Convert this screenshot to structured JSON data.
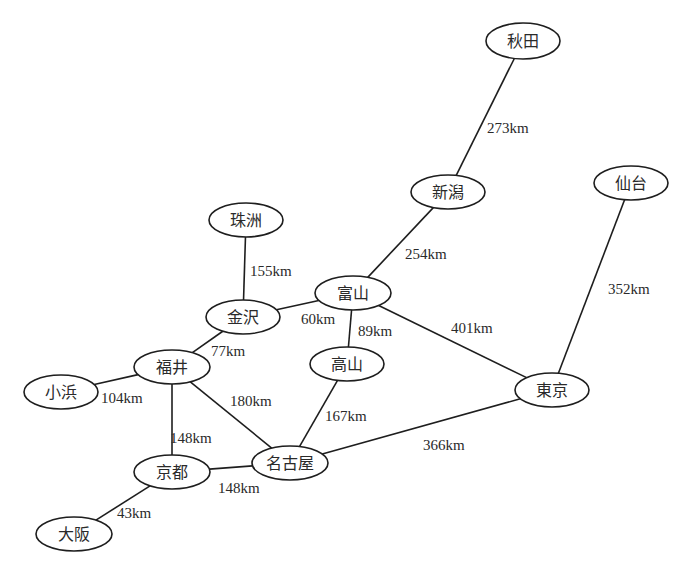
{
  "diagram": {
    "type": "graph",
    "nodes": [
      {
        "id": "akita",
        "label": "秋田",
        "x": 523,
        "y": 41,
        "rx": 37,
        "ry": 18
      },
      {
        "id": "niigata",
        "label": "新潟",
        "x": 448,
        "y": 192,
        "rx": 37,
        "ry": 17
      },
      {
        "id": "sendai",
        "label": "仙台",
        "x": 631,
        "y": 183,
        "rx": 37,
        "ry": 17
      },
      {
        "id": "suzu",
        "label": "珠洲",
        "x": 246,
        "y": 220,
        "rx": 37,
        "ry": 17
      },
      {
        "id": "toyama",
        "label": "富山",
        "x": 353,
        "y": 293,
        "rx": 38,
        "ry": 17
      },
      {
        "id": "kanazawa",
        "label": "金沢",
        "x": 243,
        "y": 317,
        "rx": 37,
        "ry": 17
      },
      {
        "id": "takayama",
        "label": "高山",
        "x": 347,
        "y": 364,
        "rx": 37,
        "ry": 17
      },
      {
        "id": "fukui",
        "label": "福井",
        "x": 172,
        "y": 367,
        "rx": 38,
        "ry": 17
      },
      {
        "id": "obama",
        "label": "小浜",
        "x": 61,
        "y": 392,
        "rx": 37,
        "ry": 17
      },
      {
        "id": "tokyo",
        "label": "東京",
        "x": 552,
        "y": 390,
        "rx": 37,
        "ry": 17
      },
      {
        "id": "nagoya",
        "label": "名古屋",
        "x": 290,
        "y": 463,
        "rx": 38,
        "ry": 17
      },
      {
        "id": "kyoto",
        "label": "京都",
        "x": 172,
        "y": 472,
        "rx": 38,
        "ry": 17
      },
      {
        "id": "osaka",
        "label": "大阪",
        "x": 74,
        "y": 534,
        "rx": 38,
        "ry": 17
      }
    ],
    "edges": [
      {
        "from": "akita",
        "to": "niigata",
        "label": "273km",
        "lx": 487,
        "ly": 130
      },
      {
        "from": "niigata",
        "to": "toyama",
        "label": "254km",
        "lx": 405,
        "ly": 256
      },
      {
        "from": "sendai",
        "to": "tokyo",
        "label": "352km",
        "lx": 608,
        "ly": 291
      },
      {
        "from": "suzu",
        "to": "kanazawa",
        "label": "155km",
        "lx": 250,
        "ly": 273
      },
      {
        "from": "kanazawa",
        "to": "toyama",
        "label": "60km",
        "lx": 301,
        "ly": 321
      },
      {
        "from": "toyama",
        "to": "takayama",
        "label": "89km",
        "lx": 358,
        "ly": 333
      },
      {
        "from": "toyama",
        "to": "tokyo",
        "label": "401km",
        "lx": 451,
        "ly": 330
      },
      {
        "from": "kanazawa",
        "to": "fukui",
        "label": "77km",
        "lx": 211,
        "ly": 353
      },
      {
        "from": "obama",
        "to": "fukui",
        "label": "104km",
        "lx": 101,
        "ly": 400
      },
      {
        "from": "fukui",
        "to": "kyoto",
        "label": "148km",
        "lx": 170,
        "ly": 440
      },
      {
        "from": "fukui",
        "to": "nagoya",
        "label": "180km",
        "lx": 230,
        "ly": 403
      },
      {
        "from": "takayama",
        "to": "nagoya",
        "label": "167km",
        "lx": 325,
        "ly": 418
      },
      {
        "from": "nagoya",
        "to": "tokyo",
        "label": "366km",
        "lx": 423,
        "ly": 447
      },
      {
        "from": "kyoto",
        "to": "nagoya",
        "label": "148km",
        "lx": 218,
        "ly": 490
      },
      {
        "from": "kyoto",
        "to": "osaka",
        "label": "43km",
        "lx": 117,
        "ly": 515
      }
    ]
  },
  "colors": {
    "line": "#1e1e1e",
    "text": "#2a2a2a",
    "background": "#ffffff"
  }
}
